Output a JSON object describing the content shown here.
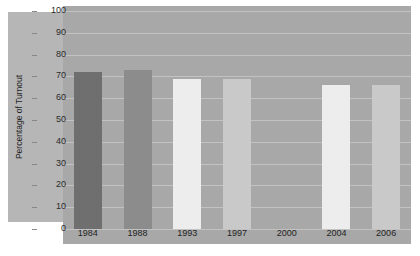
{
  "chart_data": {
    "type": "bar",
    "title": "",
    "xlabel": "",
    "ylabel": "Percentage of Turnout",
    "categories": [
      "1984",
      "1988",
      "1993",
      "1997",
      "2000",
      "2004",
      "2006"
    ],
    "values": [
      72,
      73,
      69,
      69,
      0,
      66,
      66
    ],
    "bar_colors": [
      "#6f6f6f",
      "#8c8c8c",
      "#ededed",
      "#c9c9c9",
      "#a8a8a8",
      "#ededed",
      "#c9c9c9"
    ],
    "ylim": [
      0,
      100
    ],
    "y_ticks": [
      0,
      10,
      20,
      30,
      40,
      50,
      60,
      70,
      80,
      90,
      100
    ],
    "y_tick_labels": [
      "0",
      "10",
      "20",
      "30",
      "40",
      "50",
      "60",
      "70",
      "80",
      "90",
      "100"
    ],
    "grid": true,
    "legend": "none",
    "plot_background": "#a8a8a8",
    "panel_background": "#b6b6b6"
  }
}
